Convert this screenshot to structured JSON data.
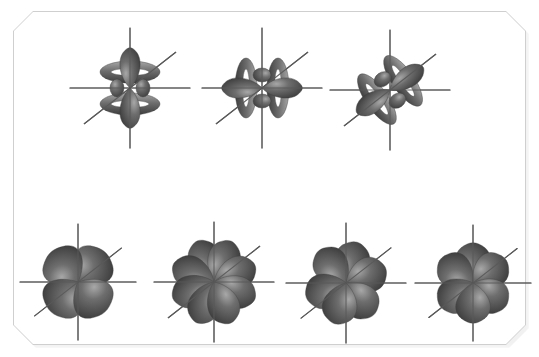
{
  "figure": {
    "background_color": "#ffffff",
    "card_color": "#ffffff",
    "card_border_color": "#cfcfcf",
    "card_shadow_color": "#e6e6e6",
    "axis_color": "#595959",
    "lobe_dark": "#3d3d3d",
    "lobe_mid": "#6e6e6e",
    "lobe_light": "#a8a8a8"
  },
  "rows": [
    {
      "name": "top-row",
      "label": "Row 1 - axial f orbitals with toroidal collars",
      "orbitals": [
        {
          "name": "orbital-fz3",
          "label": "f z-cubed",
          "type": "axial-with-rings",
          "axis_orientation": "z",
          "lobe_count": 2,
          "ring_count": 2,
          "x": 60,
          "y": 22,
          "w": 140,
          "h": 132,
          "cx": 70,
          "cy": 66,
          "axis_len_v": 60,
          "axis_len_h": 60,
          "axis_len_d": 58,
          "rotation": 0
        },
        {
          "name": "orbital-fx3",
          "label": "f x-cubed",
          "type": "axial-with-rings",
          "axis_orientation": "x",
          "lobe_count": 2,
          "ring_count": 2,
          "x": 192,
          "y": 22,
          "w": 140,
          "h": 132,
          "cx": 70,
          "cy": 66,
          "axis_len_v": 60,
          "axis_len_h": 60,
          "axis_len_d": 58,
          "rotation": 90
        },
        {
          "name": "orbital-fy3",
          "label": "f y-cubed",
          "type": "axial-with-rings",
          "axis_orientation": "y",
          "lobe_count": 2,
          "ring_count": 2,
          "x": 318,
          "y": 22,
          "w": 145,
          "h": 136,
          "cx": 72,
          "cy": 68,
          "axis_len_v": 60,
          "axis_len_h": 60,
          "axis_len_d": 58,
          "rotation": 55
        }
      ]
    },
    {
      "name": "bottom-row",
      "label": "Row 2 - multi-lobed cubic-set f orbitals",
      "orbitals": [
        {
          "name": "orbital-fxyz",
          "label": "f xyz",
          "type": "multi-lobe",
          "lobe_count": 4,
          "lobe_angles": [
            48,
            132,
            228,
            312
          ],
          "lobe_length": 40,
          "lobe_width": 30,
          "x": 18,
          "y": 222,
          "w": 120,
          "h": 120,
          "cx": 60,
          "cy": 60,
          "axis_len_v": 58,
          "axis_len_h": 58,
          "axis_len_d": 55,
          "rotation": 0
        },
        {
          "name": "orbital-fz-x2-y2",
          "label": "f z(x squared minus y squared)",
          "type": "multi-lobe",
          "lobe_count": 8,
          "lobe_angles": [
            22,
            67,
            112,
            157,
            202,
            247,
            292,
            337
          ],
          "lobe_length": 44,
          "lobe_width": 22,
          "x": 152,
          "y": 220,
          "w": 125,
          "h": 124,
          "cx": 62,
          "cy": 62,
          "axis_len_v": 60,
          "axis_len_h": 60,
          "axis_len_d": 58,
          "rotation": 0
        },
        {
          "name": "orbital-fx-z2-y2",
          "label": "f x(z squared minus y squared)",
          "type": "multi-lobe",
          "lobe_count": 6,
          "lobe_angles": [
            20,
            75,
            130,
            200,
            255,
            310
          ],
          "lobe_length": 42,
          "lobe_width": 24,
          "x": 285,
          "y": 222,
          "w": 122,
          "h": 122,
          "cx": 61,
          "cy": 61,
          "axis_len_v": 60,
          "axis_len_h": 60,
          "axis_len_d": 57,
          "rotation": 0
        },
        {
          "name": "orbital-fy-z2-x2",
          "label": "f y(z squared minus x squared)",
          "type": "multi-lobe",
          "lobe_count": 6,
          "lobe_angles": [
            35,
            90,
            145,
            215,
            270,
            325
          ],
          "lobe_length": 40,
          "lobe_width": 24,
          "x": 412,
          "y": 222,
          "w": 122,
          "h": 122,
          "cx": 61,
          "cy": 61,
          "axis_len_v": 58,
          "axis_len_h": 58,
          "axis_len_d": 56,
          "rotation": 0
        }
      ]
    }
  ]
}
